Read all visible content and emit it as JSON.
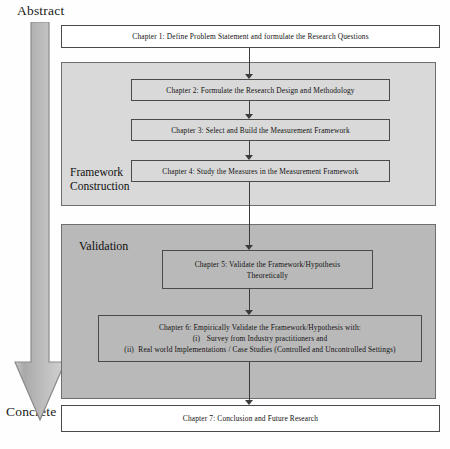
{
  "diagram": {
    "axis": {
      "top_label": "Abstract",
      "bottom_label": "Concrete",
      "arrow_icon": "down-arrow-icon"
    },
    "panels": [
      {
        "id": "framework",
        "title": "Framework\nConstruction",
        "fill": "#d9d9d9"
      },
      {
        "id": "validation",
        "title": "Validation",
        "fill": "#b9b9b9"
      }
    ],
    "boxes": {
      "ch1": "Chapter 1: Define Problem Statement and formulate the Research Questions",
      "ch2": "Chapter 2: Formulate  the Research Design and Methodology",
      "ch3": "Chapter 3:  Select and Build the Measurement Framework",
      "ch4": "Chapter 4:  Study the Measures  in the Measurement  Framework",
      "ch5_line1": "Chapter 5: Validate the Framework/Hypothesis",
      "ch5_line2": "Theoretically",
      "ch6_line1": "Chapter 6: Empirically Validate the Framework/Hypothesis with:",
      "ch6_line2_roman": "(i)",
      "ch6_line2_text": "Survey from Industry practitioners and",
      "ch6_line3_roman": "(ii)",
      "ch6_line3_text": "Real world Implementations / Case Studies (Controlled and Uncontrolled Settings)",
      "ch7": "Chapter 7: Conclusion  and Future  Research"
    },
    "colors": {
      "framework_fill": "#d9d9d9",
      "validation_fill": "#b9b9b9",
      "box_fill": "#ffffff",
      "border": "#4a4a4a",
      "arrow": "#3b3b3b",
      "axis_arrow_fill": "#b5b5b5"
    }
  }
}
